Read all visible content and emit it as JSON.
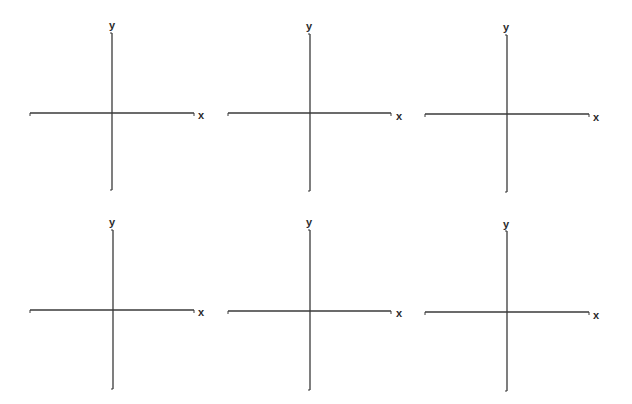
{
  "worksheet": {
    "layout": {
      "rows": 2,
      "columns": 3
    },
    "axis_color": "#3a3a3a",
    "planes": [
      {
        "x_label": "x",
        "y_label": "y"
      },
      {
        "x_label": "x",
        "y_label": "y"
      },
      {
        "x_label": "x",
        "y_label": "y"
      },
      {
        "x_label": "x",
        "y_label": "y"
      },
      {
        "x_label": "x",
        "y_label": "y"
      },
      {
        "x_label": "x",
        "y_label": "y"
      }
    ]
  }
}
